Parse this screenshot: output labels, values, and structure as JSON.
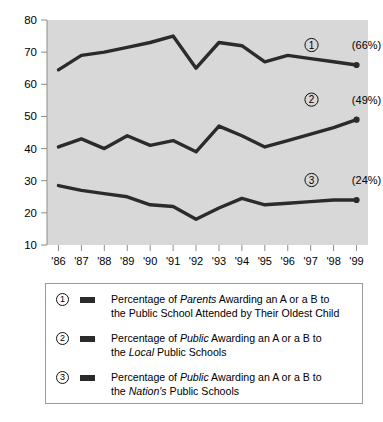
{
  "chart_data": {
    "type": "line",
    "title": "",
    "subtitle": "",
    "xlabel": "",
    "ylabel": "",
    "x": [
      "'86",
      "'87",
      "'88",
      "'89",
      "'90",
      "'91",
      "'92",
      "'93",
      "'94",
      "'95",
      "'96",
      "'97",
      "'98",
      "'99"
    ],
    "xlim": [
      "'86",
      "'99"
    ],
    "ylim": [
      10,
      80
    ],
    "yticks": [
      10,
      20,
      30,
      40,
      50,
      60,
      70,
      80
    ],
    "ytick_labels": [
      "10",
      "20",
      "30",
      "40",
      "50",
      "60",
      "70",
      "80"
    ],
    "grid": false,
    "legend_position": "below-plot",
    "plot_background": "#d8d8d8",
    "line_color": "#2b2b2b",
    "series": [
      {
        "name": "Percentage of Parents Awarding an A or a B to the Public School Attended by Their Oldest Child",
        "marker_number": "1",
        "end_label": "(66%)",
        "end_value": 66,
        "values": [
          64.5,
          69,
          70,
          71.5,
          73,
          75,
          65,
          73,
          72,
          67,
          69,
          68,
          67,
          66
        ]
      },
      {
        "name": "Percentage of Public Awarding an A or a B to the Local Public Schools",
        "marker_number": "2",
        "end_label": "(49%)",
        "end_value": 49,
        "values": [
          40.5,
          43,
          40,
          44,
          41,
          42.5,
          39,
          47,
          44,
          40.5,
          42.5,
          44.5,
          46.5,
          49
        ]
      },
      {
        "name": "Percentage of Public Awarding an A or a B to the Nation's Public Schools",
        "marker_number": "3",
        "end_label": "(24%)",
        "end_value": 24,
        "values": [
          28.5,
          27,
          26,
          25,
          22.5,
          22,
          18,
          21.5,
          24.5,
          22.5,
          23,
          23.5,
          24,
          24
        ]
      }
    ]
  },
  "legend": {
    "items": [
      {
        "number": "1",
        "line_1_pre": "Percentage of ",
        "line_1_em": "Parents",
        "line_1_post": " Awarding an A or a B to",
        "line_2_pre": "the Public School Attended by Their Oldest Child",
        "line_2_em": "",
        "line_2_post": ""
      },
      {
        "number": "2",
        "line_1_pre": "Percentage of ",
        "line_1_em": "Public",
        "line_1_post": " Awarding an A or a B to",
        "line_2_pre": "the ",
        "line_2_em": "Local",
        "line_2_post": " Public Schools"
      },
      {
        "number": "3",
        "line_1_pre": "Percentage of ",
        "line_1_em": "Public",
        "line_1_post": " Awarding an A or a B to",
        "line_2_pre": "the ",
        "line_2_em": "Nation's",
        "line_2_post": " Public Schools"
      }
    ]
  }
}
